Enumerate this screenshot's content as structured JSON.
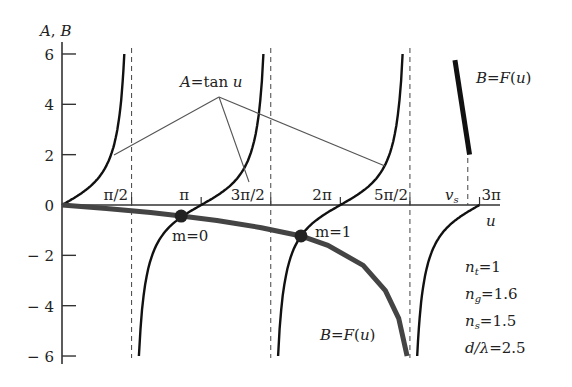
{
  "chart_data": {
    "type": "line",
    "title": "",
    "xlabel": "u",
    "ylabel": "A, B",
    "xlim": [
      0,
      9.4248
    ],
    "ylim": [
      -6,
      6
    ],
    "yticks": [
      6,
      4,
      2,
      0,
      -2,
      -4,
      -6
    ],
    "ytick_labels": [
      "6",
      "4",
      "2",
      "0",
      "− 2",
      "− 4",
      "− 6"
    ],
    "xticks": [
      1.5708,
      3.1416,
      4.7124,
      6.2832,
      7.854,
      9.4248
    ],
    "xtick_labels": [
      "π/2",
      "π",
      "3π/2",
      "2π",
      "5π/2",
      "3π"
    ],
    "asymptotes": [
      1.5708,
      4.7124,
      7.854
    ],
    "vs_label": "v",
    "vs_sub": "s",
    "vs_value": 9.16,
    "series": [
      {
        "name": "A = tan u",
        "label_A": "A",
        "label_eq": "=tan",
        "label_u": "u",
        "function": "tan(u)"
      },
      {
        "name": "B = F(u)",
        "label_B": "B",
        "label_eq": "=F(",
        "label_u": "u",
        "label_close": ")",
        "points": [
          [
            0,
            0
          ],
          [
            1.0,
            -0.14
          ],
          [
            2.0,
            -0.3
          ],
          [
            2.69,
            -0.44
          ],
          [
            3.5,
            -0.62
          ],
          [
            4.5,
            -0.9
          ],
          [
            5.395,
            -1.23
          ],
          [
            6.0,
            -1.6
          ],
          [
            6.8,
            -2.4
          ],
          [
            7.3,
            -3.4
          ],
          [
            7.6,
            -4.5
          ],
          [
            7.79,
            -6
          ]
        ],
        "upper_branch": [
          [
            8.87,
            5.76
          ],
          [
            9.2,
            2.0
          ]
        ]
      }
    ],
    "intersections": [
      {
        "label": "m=0",
        "u": 2.69,
        "value": -0.44
      },
      {
        "label": "m=1",
        "u": 5.395,
        "value": -1.23
      }
    ],
    "parameters": [
      {
        "sym": "n",
        "sub": "t",
        "val": "=1"
      },
      {
        "sym": "n",
        "sub": "g",
        "val": "=1.6"
      },
      {
        "sym": "n",
        "sub": "s",
        "val": "=1.5"
      },
      {
        "sym": "d/λ",
        "sub": "",
        "val": "=2.5"
      }
    ]
  }
}
